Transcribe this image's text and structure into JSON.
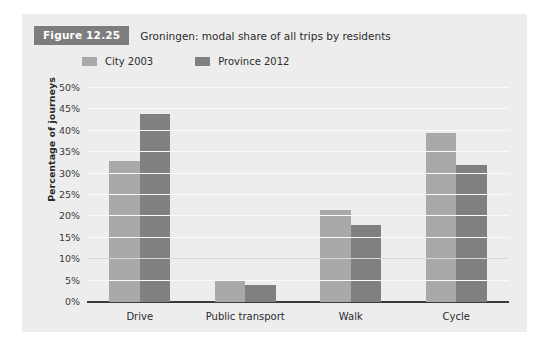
{
  "figure": {
    "badge": "Figure 12.25",
    "title": "Groningen: modal share of all trips by residents"
  },
  "chart_data": {
    "type": "bar",
    "title": "Groningen: modal share of all trips by residents",
    "xlabel": "",
    "ylabel": "Percentage of journeys",
    "categories": [
      "Drive",
      "Public transport",
      "Walk",
      "Cycle"
    ],
    "series": [
      {
        "name": "City 2003",
        "color": "#a9a9a9",
        "values": [
          33,
          5,
          21.5,
          39.5
        ]
      },
      {
        "name": "Province 2012",
        "color": "#808080",
        "values": [
          44,
          4,
          18,
          32
        ]
      }
    ],
    "ylim": [
      0,
      50
    ],
    "ytick_step": 5,
    "ytick_labels": [
      "0%",
      "5%",
      "10%",
      "15%",
      "20%",
      "25%",
      "30%",
      "35%",
      "40%",
      "45%",
      "50%"
    ],
    "grid": true,
    "legend_position": "top-left"
  },
  "colors": {
    "panel_background": "#ededed",
    "badge_background": "#7d7d7d",
    "badge_text": "#ffffff",
    "series_one": "#a9a9a9",
    "series_two": "#808080",
    "gridline": "#fbfbfb",
    "axis": "#3a3a3a"
  }
}
